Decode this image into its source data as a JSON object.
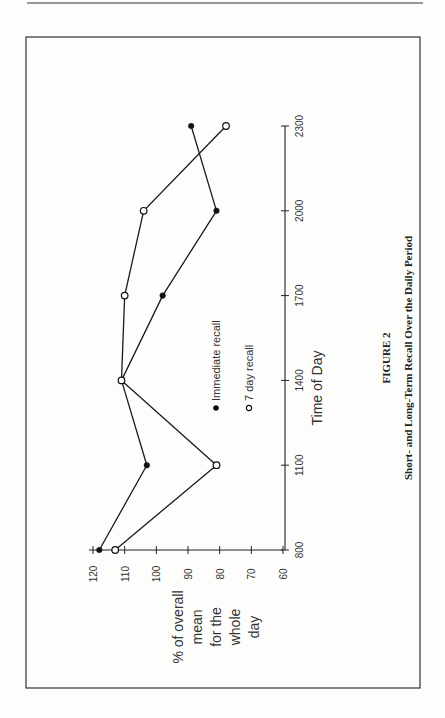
{
  "page": {
    "page_number": "",
    "figure_label": "FIGURE 2",
    "figure_caption": "Short- and Long-Term Recall Over the Daily Period"
  },
  "chart_data": {
    "type": "line",
    "orientation_note": "rotated 90° counter-clockwise on page",
    "title": "Short- and Long-Term Recall Over the Daily Period",
    "figure_label": "FIGURE 2",
    "xlabel": "Time of Day",
    "ylabel": "% of overall mean for the whole day",
    "x": [
      800,
      1100,
      1400,
      1700,
      2000,
      2300
    ],
    "x_ticks": [
      "800",
      "1100",
      "1400",
      "1700",
      "2000",
      "2300"
    ],
    "y_ticks": [
      "120",
      "110",
      "100",
      "90",
      "80",
      "70",
      "60"
    ],
    "ylim": [
      60,
      120
    ],
    "grid": false,
    "legend_position": "inside, center",
    "series": [
      {
        "name": "Immediate recall",
        "marker": "filled-circle",
        "values": [
          118,
          103,
          111,
          98,
          81,
          89
        ]
      },
      {
        "name": "7 day recall",
        "marker": "open-circle",
        "values": [
          113,
          81,
          111,
          110,
          104,
          78
        ]
      }
    ]
  },
  "labels": {
    "ylabel_lines": [
      "% of overall",
      "mean",
      "for the",
      "whole",
      "day"
    ],
    "legend_immediate": "Immediate recall",
    "legend_seven_day": "7 day recall",
    "xlabel": "Time of Day"
  }
}
